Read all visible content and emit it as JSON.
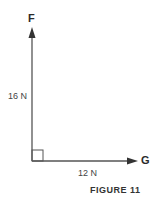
{
  "diagram": {
    "vectors": [
      {
        "name": "F",
        "magnitude": "16 N",
        "direction": "up"
      },
      {
        "name": "G",
        "magnitude": "12 N",
        "direction": "right"
      }
    ],
    "right_angle_marker": true,
    "caption": "FIGURE 11",
    "line_color": "#555555"
  }
}
